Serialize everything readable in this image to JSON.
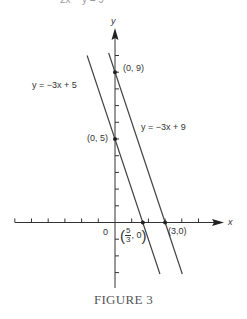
{
  "figure": {
    "caption": "FIGURE 3",
    "top_cropped_text": "2x − y = 9"
  },
  "axes": {
    "x_label": "x",
    "y_label": "y",
    "origin_label": "0",
    "x_ticks": [
      -6,
      -5,
      -4,
      -3,
      -2,
      -1,
      1,
      2,
      3,
      4,
      5
    ],
    "y_ticks": [
      -3,
      -2,
      -1,
      1,
      2,
      3,
      4,
      5,
      6,
      7,
      8,
      9,
      10
    ]
  },
  "lines": [
    {
      "equation_label": "y = −3x + 5",
      "slope": -3,
      "intercept": 5
    },
    {
      "equation_label": "y = −3x + 9",
      "slope": -3,
      "intercept": 9
    }
  ],
  "points": [
    {
      "label": "(0, 9)",
      "x": 0,
      "y": 9
    },
    {
      "label": "(0, 5)",
      "x": 0,
      "y": 5
    },
    {
      "label_num": "5",
      "label_den": "3",
      "label_rest": ", 0",
      "x": 1.667,
      "y": 0
    },
    {
      "label": "(3,0)",
      "x": 3,
      "y": 0
    }
  ],
  "chart_data": {
    "type": "line",
    "title": "FIGURE 3",
    "xlabel": "x",
    "ylabel": "y",
    "xlim": [
      -6,
      6
    ],
    "ylim": [
      -4,
      11
    ],
    "grid": false,
    "series": [
      {
        "name": "y = −3x + 5",
        "x": [
          -1.67,
          2.69
        ],
        "y": [
          10.0,
          -3.08
        ]
      },
      {
        "name": "y = −3x + 9",
        "x": [
          -0.38,
          4.03
        ],
        "y": [
          10.15,
          -3.08
        ]
      }
    ],
    "annotations": [
      {
        "text": "(0, 9)",
        "x": 0,
        "y": 9
      },
      {
        "text": "(0, 5)",
        "x": 0,
        "y": 5
      },
      {
        "text": "(5/3, 0)",
        "x": 1.667,
        "y": 0
      },
      {
        "text": "(3,0)",
        "x": 3,
        "y": 0
      }
    ]
  }
}
